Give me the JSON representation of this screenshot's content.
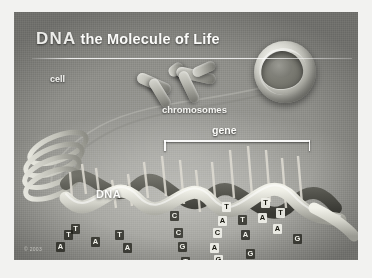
{
  "poster": {
    "title_emphasis": "DNA",
    "title_rest": "the Molecule of Life",
    "credit": "© 2003",
    "palette": {
      "plate_base": "#8f8f8a",
      "ink_light": "#f4f4f1",
      "ink_dark": "#17170f",
      "rule": "#ffffff"
    }
  },
  "labels": {
    "cell": "cell",
    "chromosomes": "chromosomes",
    "gene": "gene",
    "dna": "DNA"
  },
  "diagram": {
    "type": "biology-illustration",
    "elements": [
      {
        "name": "cell",
        "label": "cell",
        "shape": "cutaway-sphere"
      },
      {
        "name": "chromosomes",
        "label": "chromosomes",
        "shape": "paired-rods"
      },
      {
        "name": "gene",
        "label": "gene",
        "shape": "bracket-span"
      },
      {
        "name": "dna",
        "label": "DNA",
        "shape": "double-helix"
      }
    ],
    "base_pairs": [
      {
        "top": "T",
        "bottom": "A"
      },
      {
        "top": "A",
        "bottom": "T"
      },
      {
        "top": "C",
        "bottom": "G"
      },
      {
        "top": "C",
        "bottom": "G"
      },
      {
        "top": "G",
        "bottom": "C"
      },
      {
        "top": "T",
        "bottom": "A"
      },
      {
        "top": "A",
        "bottom": "T"
      },
      {
        "top": "A",
        "bottom": "T"
      },
      {
        "top": "C",
        "bottom": "G"
      },
      {
        "top": "G",
        "bottom": "C"
      },
      {
        "top": "T",
        "bottom": "A"
      },
      {
        "top": "A",
        "bottom": "T"
      },
      {
        "top": "T",
        "bottom": "A"
      },
      {
        "top": "A",
        "bottom": "T"
      },
      {
        "top": "G",
        "bottom": "C"
      }
    ],
    "visible_bases": [
      {
        "letter": "T",
        "x": 50,
        "y": 118,
        "tone": "light"
      },
      {
        "letter": "A",
        "x": 42,
        "y": 130,
        "tone": "light"
      },
      {
        "letter": "T",
        "x": 57,
        "y": 112,
        "tone": "light"
      },
      {
        "letter": "A",
        "x": 77,
        "y": 125,
        "tone": "light"
      },
      {
        "letter": "T",
        "x": 101,
        "y": 118,
        "tone": "light"
      },
      {
        "letter": "A",
        "x": 109,
        "y": 131,
        "tone": "light"
      },
      {
        "letter": "C",
        "x": 156,
        "y": 99,
        "tone": "light"
      },
      {
        "letter": "C",
        "x": 160,
        "y": 116,
        "tone": "light"
      },
      {
        "letter": "G",
        "x": 164,
        "y": 130,
        "tone": "light"
      },
      {
        "letter": "T",
        "x": 167,
        "y": 145,
        "tone": "light"
      },
      {
        "letter": "A",
        "x": 170,
        "y": 158,
        "tone": "light"
      },
      {
        "letter": "T",
        "x": 175,
        "y": 172,
        "tone": "light"
      },
      {
        "letter": "T",
        "x": 208,
        "y": 90,
        "tone": "dark"
      },
      {
        "letter": "A",
        "x": 204,
        "y": 104,
        "tone": "dark"
      },
      {
        "letter": "C",
        "x": 199,
        "y": 116,
        "tone": "dark"
      },
      {
        "letter": "A",
        "x": 196,
        "y": 131,
        "tone": "dark"
      },
      {
        "letter": "G",
        "x": 200,
        "y": 143,
        "tone": "dark"
      },
      {
        "letter": "A",
        "x": 192,
        "y": 152,
        "tone": "dark"
      },
      {
        "letter": "T",
        "x": 196,
        "y": 166,
        "tone": "dark"
      },
      {
        "letter": "T",
        "x": 224,
        "y": 103,
        "tone": "light"
      },
      {
        "letter": "A",
        "x": 227,
        "y": 118,
        "tone": "light"
      },
      {
        "letter": "G",
        "x": 232,
        "y": 137,
        "tone": "light"
      },
      {
        "letter": "T",
        "x": 247,
        "y": 86,
        "tone": "dark"
      },
      {
        "letter": "A",
        "x": 244,
        "y": 101,
        "tone": "dark"
      },
      {
        "letter": "T",
        "x": 262,
        "y": 96,
        "tone": "dark"
      },
      {
        "letter": "A",
        "x": 259,
        "y": 112,
        "tone": "dark"
      },
      {
        "letter": "G",
        "x": 279,
        "y": 122,
        "tone": "light"
      },
      {
        "letter": "C",
        "x": 280,
        "y": 152,
        "tone": "light"
      }
    ]
  }
}
